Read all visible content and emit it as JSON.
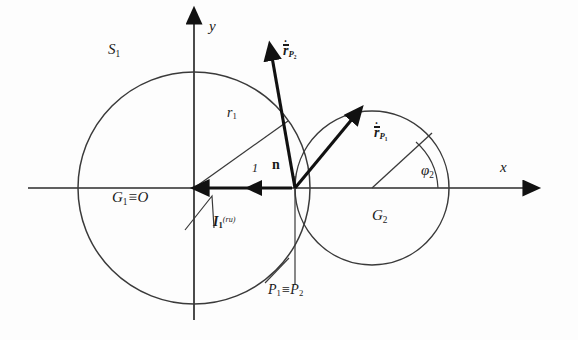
{
  "figure": {
    "type": "geometry-diagram",
    "axes": {
      "x_label": "x",
      "y_label": "y",
      "origin_label": "G",
      "origin_sub": "1",
      "origin_equiv": "≡O"
    },
    "circles": [
      {
        "name": "S1",
        "label": "S",
        "sub": "1",
        "center_label": "G",
        "center_sub": "1",
        "cx": 194,
        "cy": 188,
        "r": 116
      },
      {
        "name": "G2",
        "label": "G",
        "sub": "2",
        "cx": 372,
        "cy": 188,
        "r": 77
      }
    ],
    "labels": {
      "circle1_outline": {
        "base": "S",
        "sub": "1"
      },
      "circle1_center": {
        "base": "G",
        "sub": "1",
        "suffix": "≡O"
      },
      "circle2_center": {
        "base": "G",
        "sub": "2"
      },
      "radius1": {
        "base": "r",
        "sub": "1"
      },
      "contact_point": {
        "base": "P",
        "sub": "1",
        "suffix": "≡P",
        "suffix_sub": "2"
      },
      "angle2": {
        "base": "φ",
        "sub": "2"
      },
      "normal": {
        "base": "n"
      },
      "unit_one": {
        "base": "1"
      },
      "velocity_P2": {
        "base": "r",
        "sub": "P",
        "sub2": "2",
        "accent": "dot-bar"
      },
      "velocity_P1": {
        "base": "r",
        "sub": "P",
        "sub2": "1",
        "accent": "dot-bar"
      },
      "impulse": {
        "base": "I",
        "sub": "1",
        "sup": "(ru)"
      }
    },
    "colors": {
      "stroke": "#2b2b2b",
      "heavy_stroke": "#111111",
      "background": "#fdfdfd",
      "text": "#1a1a1a"
    }
  }
}
